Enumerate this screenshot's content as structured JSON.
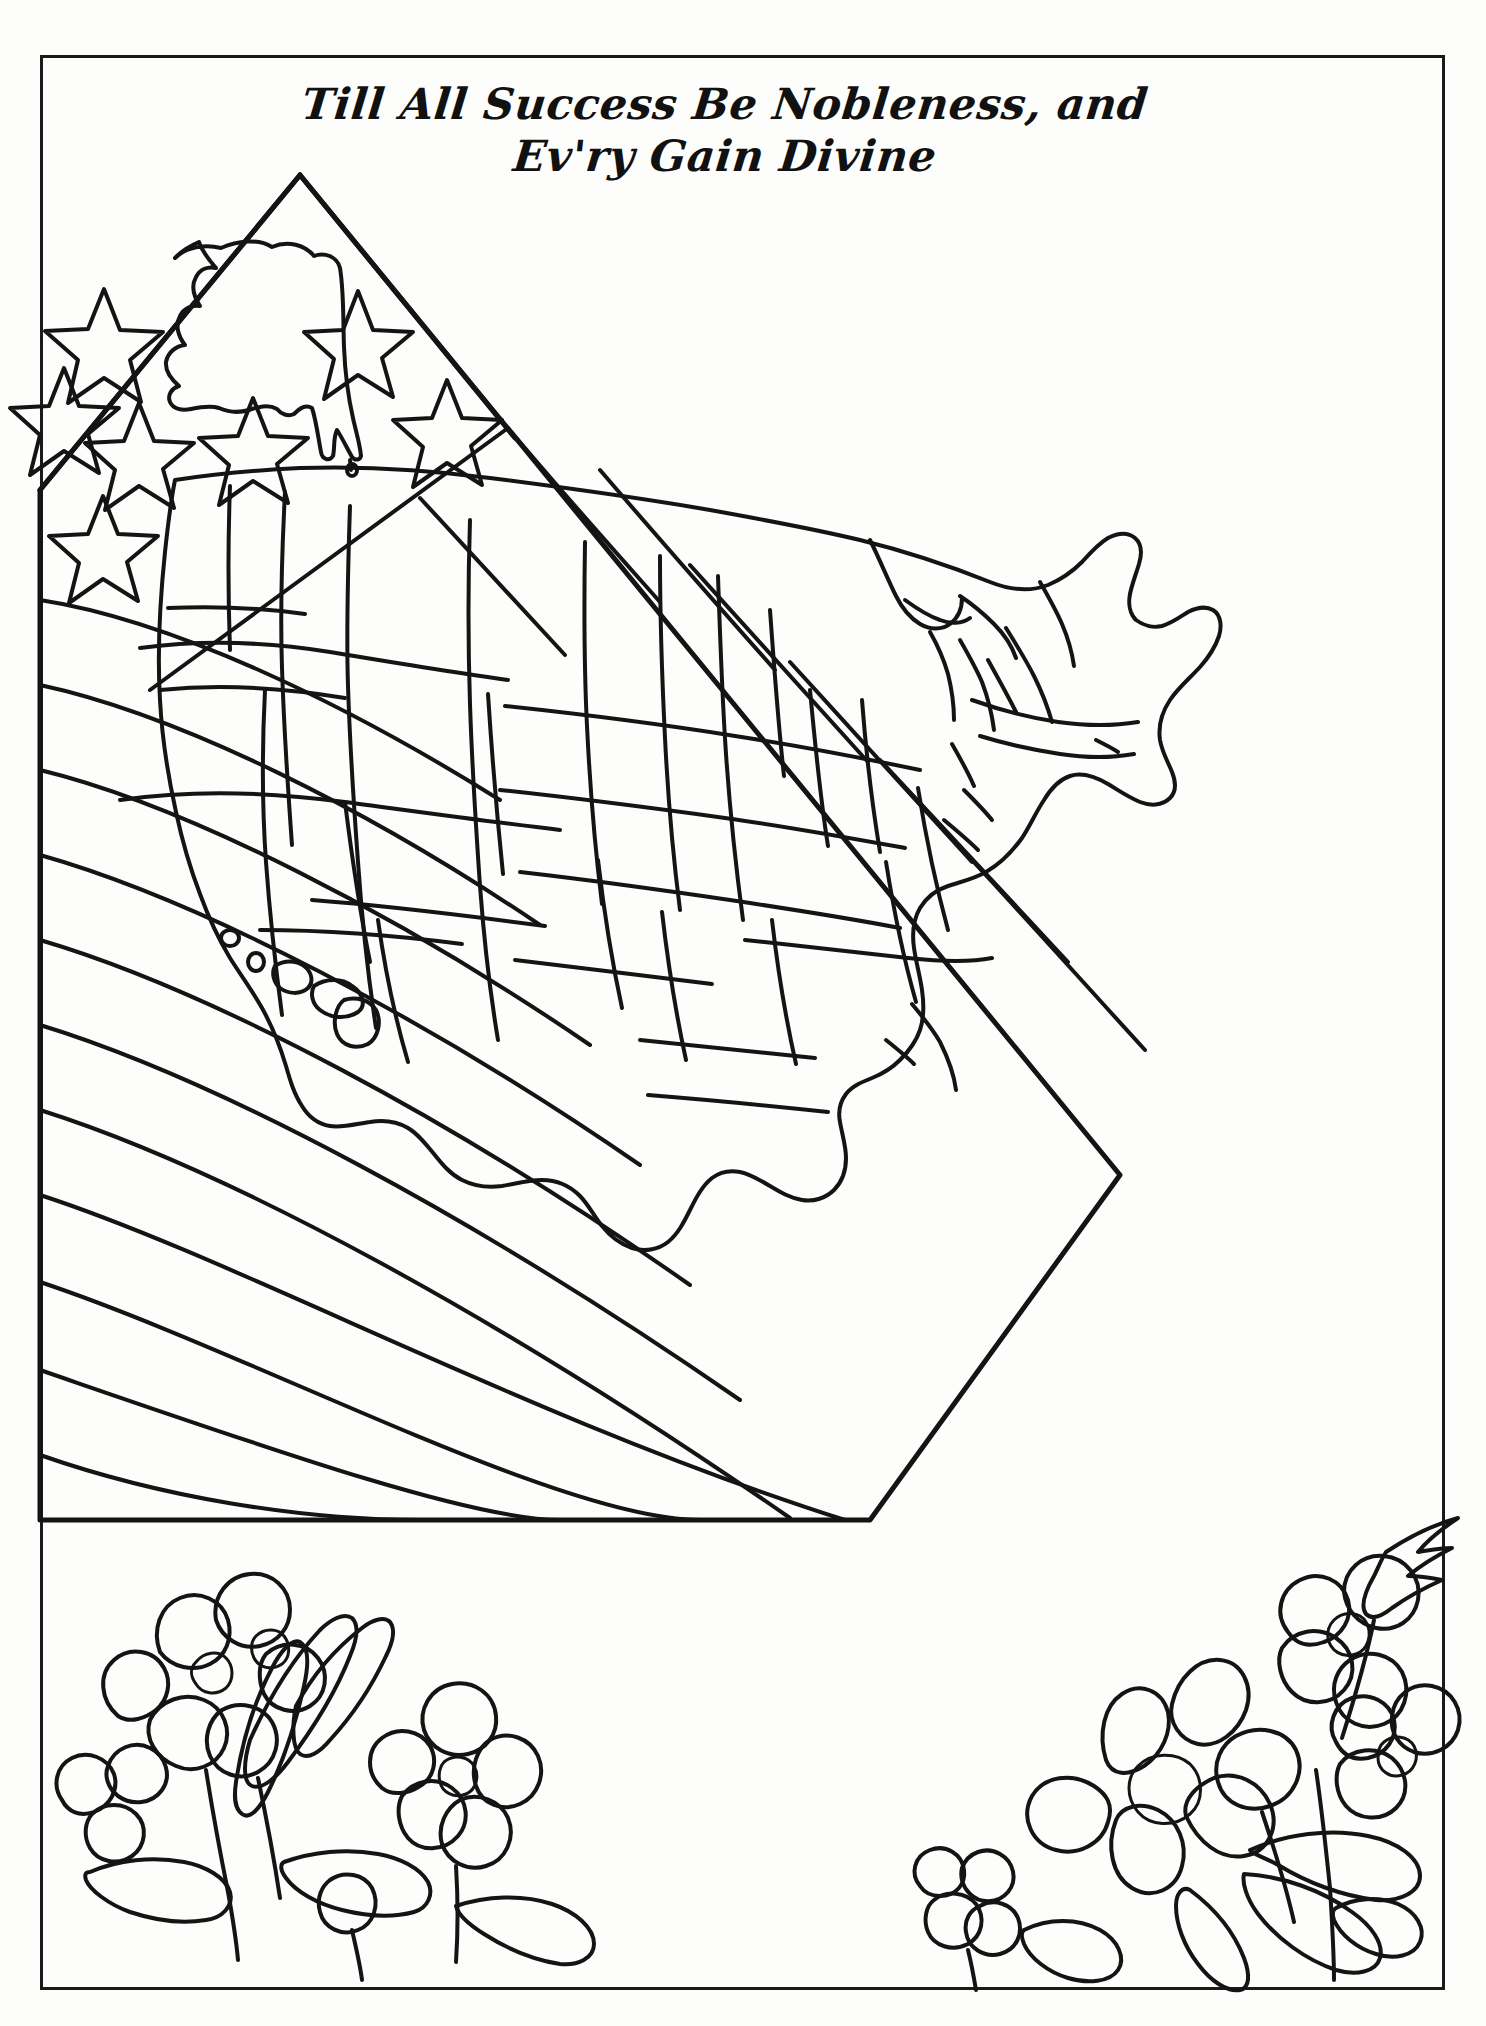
{
  "page": {
    "kind": "coloring-page",
    "background_color": "#ffffff",
    "ink_color": "#111111",
    "border": {
      "color": "#1a1a1a",
      "width_px": 3
    }
  },
  "title": {
    "line1": "Till All Success Be Nobleness, and",
    "line2": "Ev'ry Gain Divine",
    "full": "Till All Success Be Nobleness, and Ev'ry Gain Divine",
    "style": "bold script italic",
    "color": "#111111"
  },
  "artwork": {
    "name": "american-flag-with-us-state-map",
    "description": "Line-art coloring page: a tilted United States flag filling the page with an outlined map of the United States overlaid on it, plus violet and daisy flowers in the lower corners.",
    "elements": [
      {
        "name": "flag",
        "stars_visible": 6,
        "stripes_visible": 9,
        "tilt": "rotated counter-clockwise"
      },
      {
        "name": "canton",
        "label": "star field"
      },
      {
        "name": "us-map",
        "regions": "48 contiguous state outlines"
      },
      {
        "name": "alaska",
        "position": "upper-left over canton"
      },
      {
        "name": "hawaii",
        "position": "lower-left island chain"
      },
      {
        "name": "violet-flowers-left",
        "count": 4
      },
      {
        "name": "violet-flowers-right",
        "count": 3
      },
      {
        "name": "daisy-flower",
        "position": "bottom-right"
      },
      {
        "name": "leaves",
        "position": "both bottom corners"
      }
    ]
  }
}
